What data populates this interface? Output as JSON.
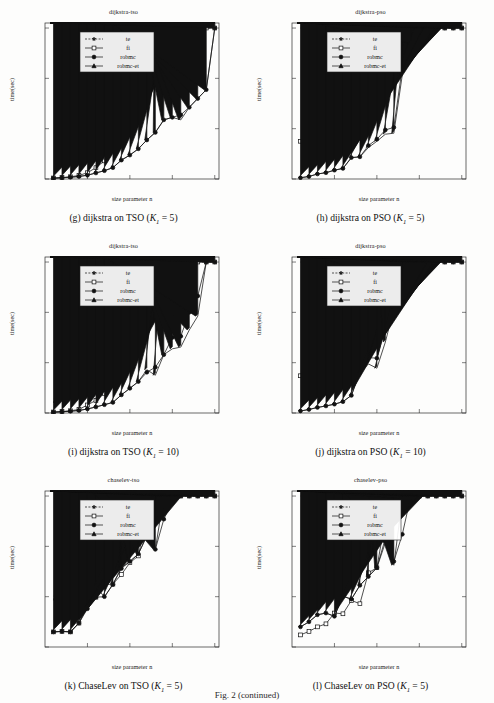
{
  "figure": {
    "fig_label": "Fig. 2 (continued)",
    "axis": {
      "xlabel": "size parameter n",
      "ylabel": "time(sec)",
      "xticks": [
        10,
        20,
        30,
        40
      ],
      "yticks": [
        0,
        200,
        400,
        600
      ],
      "xlim": [
        0,
        41
      ],
      "ylim": [
        0,
        620
      ]
    },
    "legend": {
      "position": "top-left-inset",
      "entries": [
        {
          "label": "te",
          "marker": "star",
          "line": "dashed"
        },
        {
          "label": "fi",
          "marker": "open-square",
          "line": "solid"
        },
        {
          "label": "robmc",
          "marker": "filled-circle",
          "line": "solid"
        },
        {
          "label": "robmc-et",
          "marker": "filled-triangle",
          "line": "solid"
        }
      ]
    }
  },
  "panels": [
    {
      "id": "g",
      "plot_title": "dijkstra-tso",
      "caption_prefix": "(g)",
      "caption_text": "dijkstra on TSO",
      "caption_param_k": "K",
      "caption_param_sub": "1",
      "caption_param_val": "= 5",
      "chart_data": {
        "type": "line",
        "title": "dijkstra-tso",
        "xlabel": "size parameter n",
        "ylabel": "time(sec)",
        "xlim": [
          0,
          41
        ],
        "ylim": [
          0,
          620
        ],
        "grid": false,
        "x": [
          2,
          4,
          6,
          8,
          10,
          12,
          14,
          16,
          18,
          20,
          22,
          24,
          26,
          28,
          30,
          32,
          34,
          36,
          38,
          40
        ],
        "series": [
          {
            "name": "te",
            "style": "dashed",
            "marker": "star",
            "values": [
              8,
              95,
              240,
              600,
              600,
              600,
              600,
              600,
              600,
              600,
              600,
              600,
              600,
              600,
              600,
              600,
              600,
              600,
              600,
              600
            ]
          },
          {
            "name": "fi",
            "style": "solid",
            "marker": "open-square",
            "values": [
              4,
              6,
              9,
              14,
              25,
              45,
              72,
              112,
              160,
              222,
              300,
              545,
              600,
              600,
              600,
              600,
              600,
              600,
              600,
              600
            ]
          },
          {
            "name": "robmc",
            "style": "solid",
            "marker": "filled-circle",
            "values": [
              3,
              5,
              7,
              10,
              15,
              24,
              33,
              45,
              75,
              95,
              120,
              155,
              185,
              235,
              245,
              255,
              285,
              320,
              355,
              600
            ]
          },
          {
            "name": "robmc-et",
            "style": "solid",
            "marker": "filled-triangle",
            "values": [
              3,
              5,
              7,
              10,
              15,
              24,
              33,
              45,
              75,
              95,
              120,
              155,
              185,
              235,
              245,
              235,
              285,
              320,
              355,
              600
            ]
          }
        ]
      }
    },
    {
      "id": "h",
      "plot_title": "dijkstra-pso",
      "caption_prefix": "(h)",
      "caption_text": "dijkstra on PSO",
      "caption_param_k": "K",
      "caption_param_sub": "1",
      "caption_param_val": "= 5",
      "chart_data": {
        "type": "line",
        "title": "dijkstra-pso",
        "xlabel": "size parameter n",
        "ylabel": "time(sec)",
        "xlim": [
          0,
          41
        ],
        "ylim": [
          0,
          620
        ],
        "grid": false,
        "x": [
          2,
          4,
          6,
          8,
          10,
          12,
          14,
          16,
          18,
          20,
          22,
          24,
          26,
          28,
          30,
          32,
          34,
          36,
          38,
          40
        ],
        "series": [
          {
            "name": "te",
            "style": "dashed",
            "marker": "star",
            "values": [
              600,
              600,
              600,
              600,
              600,
              600,
              600,
              600,
              600,
              600,
              600,
              600,
              600,
              600,
              600,
              600,
              600,
              600,
              600,
              600
            ]
          },
          {
            "name": "fi",
            "style": "solid",
            "marker": "open-square",
            "values": [
              150,
              222,
              430,
              600,
              600,
              600,
              600,
              600,
              600,
              600,
              600,
              600,
              600,
              600,
              600,
              600,
              600,
              600,
              600,
              600
            ]
          },
          {
            "name": "robmc",
            "style": "solid",
            "marker": "filled-circle",
            "values": [
              5,
              10,
              20,
              25,
              35,
              42,
              85,
              88,
              133,
              158,
              195,
              205,
              445,
              600,
              600,
              600,
              600,
              600,
              600,
              600
            ]
          },
          {
            "name": "robmc-et",
            "style": "solid",
            "marker": "filled-triangle",
            "values": [
              5,
              10,
              20,
              25,
              35,
              42,
              85,
              88,
              125,
              150,
              178,
              182,
              415,
              540,
              600,
              600,
              600,
              600,
              600,
              600
            ]
          }
        ]
      }
    },
    {
      "id": "i",
      "plot_title": "dijkstra-tso",
      "caption_prefix": "(i)",
      "caption_text": "dijkstra on TSO",
      "caption_param_k": "K",
      "caption_param_sub": "1",
      "caption_param_val": "= 10",
      "chart_data": {
        "type": "line",
        "title": "dijkstra-tso",
        "xlabel": "size parameter n",
        "ylabel": "time(sec)",
        "xlim": [
          0,
          41
        ],
        "ylim": [
          0,
          620
        ],
        "grid": false,
        "x": [
          2,
          4,
          6,
          8,
          10,
          12,
          14,
          16,
          18,
          20,
          22,
          24,
          26,
          28,
          30,
          32,
          34,
          36,
          38,
          40
        ],
        "series": [
          {
            "name": "te",
            "style": "dashed",
            "marker": "star",
            "values": [
              40,
              215,
              600,
              600,
              600,
              600,
              600,
              600,
              600,
              600,
              600,
              600,
              600,
              600,
              600,
              600,
              600,
              600,
              600,
              600
            ]
          },
          {
            "name": "fi",
            "style": "solid",
            "marker": "open-square",
            "values": [
              4,
              6,
              9,
              14,
              32,
              50,
              78,
              110,
              155,
              215,
              295,
              560,
              600,
              600,
              600,
              600,
              600,
              600,
              600,
              600
            ]
          },
          {
            "name": "robmc",
            "style": "solid",
            "marker": "filled-circle",
            "values": [
              3,
              5,
              7,
              10,
              16,
              24,
              33,
              42,
              72,
              98,
              125,
              162,
              182,
              232,
              300,
              305,
              400,
              465,
              600,
              600
            ]
          },
          {
            "name": "robmc-et",
            "style": "solid",
            "marker": "filled-triangle",
            "values": [
              3,
              5,
              7,
              10,
              16,
              24,
              33,
              42,
              72,
              98,
              125,
              172,
              150,
              232,
              255,
              262,
              330,
              385,
              600,
              600
            ]
          }
        ]
      }
    },
    {
      "id": "j",
      "plot_title": "dijkstra-pso",
      "caption_prefix": "(j)",
      "caption_text": "dijkstra on PSO",
      "caption_param_k": "K",
      "caption_param_sub": "1",
      "caption_param_val": "= 10",
      "chart_data": {
        "type": "line",
        "title": "dijkstra-pso",
        "xlabel": "size parameter n",
        "ylabel": "time(sec)",
        "xlim": [
          0,
          41
        ],
        "ylim": [
          0,
          620
        ],
        "grid": false,
        "x": [
          2,
          4,
          6,
          8,
          10,
          12,
          14,
          16,
          18,
          20,
          22,
          24,
          26,
          28,
          30,
          32,
          34,
          36,
          38,
          40
        ],
        "series": [
          {
            "name": "te",
            "style": "dashed",
            "marker": "star",
            "values": [
              600,
              600,
              600,
              600,
              600,
              600,
              600,
              600,
              600,
              600,
              600,
              600,
              600,
              600,
              600,
              600,
              600,
              600,
              600,
              600
            ]
          },
          {
            "name": "fi",
            "style": "solid",
            "marker": "open-square",
            "values": [
              148,
              220,
              428,
              600,
              600,
              600,
              600,
              600,
              600,
              600,
              600,
              600,
              600,
              600,
              600,
              600,
              600,
              600,
              600,
              600
            ]
          },
          {
            "name": "robmc",
            "style": "solid",
            "marker": "filled-circle",
            "values": [
              8,
              14,
              22,
              28,
              35,
              45,
              70,
              165,
              220,
              218,
              335,
              475,
              600,
              600,
              600,
              600,
              600,
              600,
              600,
              600
            ]
          },
          {
            "name": "robmc-et",
            "style": "solid",
            "marker": "filled-triangle",
            "values": [
              8,
              14,
              22,
              28,
              35,
              45,
              70,
              158,
              195,
              178,
              282,
              415,
              515,
              600,
              600,
              600,
              600,
              600,
              600,
              600
            ]
          }
        ]
      }
    },
    {
      "id": "k",
      "plot_title": "chaselev-tso",
      "caption_prefix": "(k)",
      "caption_text": "ChaseLev on TSO",
      "caption_param_k": "K",
      "caption_param_sub": "1",
      "caption_param_val": "= 5",
      "chart_data": {
        "type": "line",
        "title": "chaselev-tso",
        "xlabel": "size parameter n",
        "ylabel": "time(sec)",
        "xlim": [
          0,
          41
        ],
        "ylim": [
          0,
          620
        ],
        "grid": false,
        "x": [
          2,
          4,
          6,
          8,
          10,
          12,
          14,
          16,
          18,
          20,
          22,
          24,
          26,
          28,
          30,
          32,
          34,
          36,
          38,
          40
        ],
        "series": [
          {
            "name": "te",
            "style": "dashed",
            "marker": "star",
            "values": [
              185,
              390,
              600,
              600,
              600,
              600,
              600,
              600,
              600,
              600,
              600,
              600,
              600,
              600,
              600,
              600,
              600,
              600,
              600,
              600
            ]
          },
          {
            "name": "fi",
            "style": "solid",
            "marker": "open-square",
            "values": [
              60,
              62,
              60,
              95,
              170,
              198,
              248,
              250,
              288,
              335,
              362,
              528,
              578,
              600,
              600,
              600,
              600,
              600,
              600,
              600
            ]
          },
          {
            "name": "robmc",
            "style": "solid",
            "marker": "filled-circle",
            "values": [
              60,
              62,
              60,
              95,
              152,
              198,
              200,
              248,
              312,
              340,
              370,
              442,
              388,
              508,
              578,
              600,
              600,
              600,
              600,
              600
            ]
          },
          {
            "name": "robmc-et",
            "style": "solid",
            "marker": "filled-triangle",
            "values": [
              60,
              62,
              60,
              95,
              160,
              242,
              198,
              250,
              315,
              340,
              370,
              442,
              388,
              600,
              600,
              600,
              600,
              600,
              600,
              600
            ]
          }
        ]
      }
    },
    {
      "id": "l",
      "plot_title": "chaselev-pso",
      "caption_prefix": "(l)",
      "caption_text": "ChaseLev on PSO",
      "caption_param_k": "K",
      "caption_param_sub": "1",
      "caption_param_val": "= 5",
      "chart_data": {
        "type": "line",
        "title": "chaselev-pso",
        "xlabel": "size parameter n",
        "ylabel": "time(sec)",
        "xlim": [
          0,
          41
        ],
        "ylim": [
          0,
          620
        ],
        "grid": false,
        "x": [
          2,
          4,
          6,
          8,
          10,
          12,
          14,
          16,
          18,
          20,
          22,
          24,
          26,
          28,
          30,
          32,
          34,
          36,
          38,
          40
        ],
        "series": [
          {
            "name": "te",
            "style": "dashed",
            "marker": "star",
            "values": [
              600,
              600,
              600,
              600,
              600,
              600,
              600,
              600,
              600,
              600,
              600,
              600,
              600,
              600,
              600,
              600,
              600,
              600,
              600,
              600
            ]
          },
          {
            "name": "fi",
            "style": "solid",
            "marker": "open-square",
            "values": [
              48,
              62,
              80,
              92,
              135,
              132,
              185,
              172,
              295,
              315,
              508,
              522,
              590,
              600,
              600,
              600,
              600,
              600,
              600,
              600
            ]
          },
          {
            "name": "robmc",
            "style": "solid",
            "marker": "filled-circle",
            "values": [
              80,
              100,
              128,
              135,
              122,
              202,
              190,
              245,
              280,
              315,
              432,
              340,
              448,
              600,
              600,
              600,
              600,
              600,
              600,
              600
            ]
          },
          {
            "name": "robmc-et",
            "style": "solid",
            "marker": "filled-triangle",
            "values": [
              80,
              100,
              128,
              135,
              122,
              202,
              190,
              245,
              280,
              315,
              415,
              325,
              590,
              600,
              600,
              600,
              600,
              600,
              600,
              600
            ]
          }
        ]
      }
    }
  ]
}
